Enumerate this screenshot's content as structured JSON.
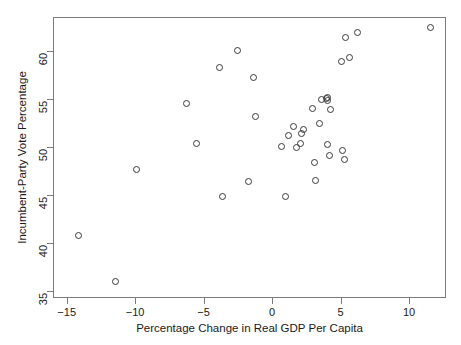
{
  "chart_data": {
    "type": "scatter",
    "title": "",
    "xlabel": "Percentage Change in Real GDP Per Capita",
    "ylabel": "Incumbent-Party Vote Percentage",
    "xlim": [
      -16.0,
      12.7
    ],
    "ylim": [
      34.3,
      63.5
    ],
    "xticks": [
      -15,
      -10,
      -5,
      0,
      5,
      10
    ],
    "xtick_labels": [
      "−15",
      "−10",
      "−5",
      "0",
      "5",
      "10"
    ],
    "yticks": [
      35,
      40,
      45,
      50,
      55,
      60
    ],
    "ytick_labels": [
      "35",
      "40",
      "45",
      "50",
      "55",
      "60"
    ],
    "grid": false,
    "legend": false,
    "marker": "open-circle",
    "marker_color": "#3a3a3a",
    "frame_color": "#7c7c7c",
    "background": "#ffffff",
    "n_points": 33,
    "points": [
      {
        "x": -14.2,
        "y": 40.9
      },
      {
        "x": -11.5,
        "y": 36.1
      },
      {
        "x": -10.0,
        "y": 47.8
      },
      {
        "x": -6.3,
        "y": 54.6
      },
      {
        "x": -5.6,
        "y": 50.5
      },
      {
        "x": -3.9,
        "y": 58.4
      },
      {
        "x": -3.7,
        "y": 45.0
      },
      {
        "x": -2.6,
        "y": 60.1
      },
      {
        "x": -1.8,
        "y": 46.5
      },
      {
        "x": -1.4,
        "y": 57.3
      },
      {
        "x": -1.3,
        "y": 53.3
      },
      {
        "x": 0.6,
        "y": 50.1
      },
      {
        "x": 0.9,
        "y": 44.9
      },
      {
        "x": 1.1,
        "y": 51.3
      },
      {
        "x": 1.5,
        "y": 52.2
      },
      {
        "x": 1.7,
        "y": 50.0
      },
      {
        "x": 2.0,
        "y": 50.5
      },
      {
        "x": 2.1,
        "y": 51.5
      },
      {
        "x": 2.2,
        "y": 51.9
      },
      {
        "x": 2.9,
        "y": 54.1
      },
      {
        "x": 3.0,
        "y": 48.5
      },
      {
        "x": 3.1,
        "y": 46.6
      },
      {
        "x": 3.4,
        "y": 52.5
      },
      {
        "x": 3.5,
        "y": 55.0
      },
      {
        "x": 3.9,
        "y": 55.1
      },
      {
        "x": 4.0,
        "y": 55.2
      },
      {
        "x": 4.0,
        "y": 54.9
      },
      {
        "x": 4.0,
        "y": 50.4
      },
      {
        "x": 4.1,
        "y": 49.2
      },
      {
        "x": 4.2,
        "y": 54.0
      },
      {
        "x": 5.0,
        "y": 59.0
      },
      {
        "x": 5.1,
        "y": 49.7
      },
      {
        "x": 5.2,
        "y": 48.8
      },
      {
        "x": 5.3,
        "y": 61.5
      },
      {
        "x": 5.6,
        "y": 59.4
      },
      {
        "x": 6.2,
        "y": 62.0
      },
      {
        "x": 11.5,
        "y": 62.5
      }
    ]
  }
}
